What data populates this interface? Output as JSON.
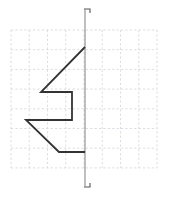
{
  "figure": {
    "title": "",
    "background_color": "#ffffff",
    "canvas": {
      "width": 174,
      "height": 197
    }
  },
  "chart_data": {
    "type": "line",
    "title": "",
    "subtitle": "",
    "xlabel": "",
    "ylabel": "",
    "grid": true,
    "grid_color": "#d8d8e0",
    "grid_style": "dashed",
    "legend": "none",
    "axis": {
      "vertical_axis_x": 85,
      "vertical_axis_y_top": 15,
      "vertical_axis_y_bottom": 181,
      "axis_color": "#8a8a8a",
      "tick_top_label": "",
      "tick_bottom_label": ""
    },
    "plot_area": {
      "x0": 11,
      "y0": 30,
      "x1": 157,
      "y1": 168,
      "cell_width": 18.25,
      "cell_height": 19.7,
      "columns": 8,
      "rows": 7
    },
    "series": [
      {
        "name": "polyline",
        "color": "#333333",
        "width": 1.8,
        "closed": false,
        "points_px": [
          [
            85,
            47
          ],
          [
            41,
            92
          ],
          [
            72,
            92
          ],
          [
            72,
            120
          ],
          [
            26,
            120
          ],
          [
            59,
            152
          ],
          [
            85,
            152
          ]
        ]
      }
    ],
    "ticks": [
      {
        "name": "tick-top",
        "x": 85,
        "y": 15,
        "shape": "corner-right-down"
      },
      {
        "name": "tick-bottom",
        "x": 85,
        "y": 181,
        "shape": "corner-right-up"
      }
    ],
    "annotations": []
  }
}
